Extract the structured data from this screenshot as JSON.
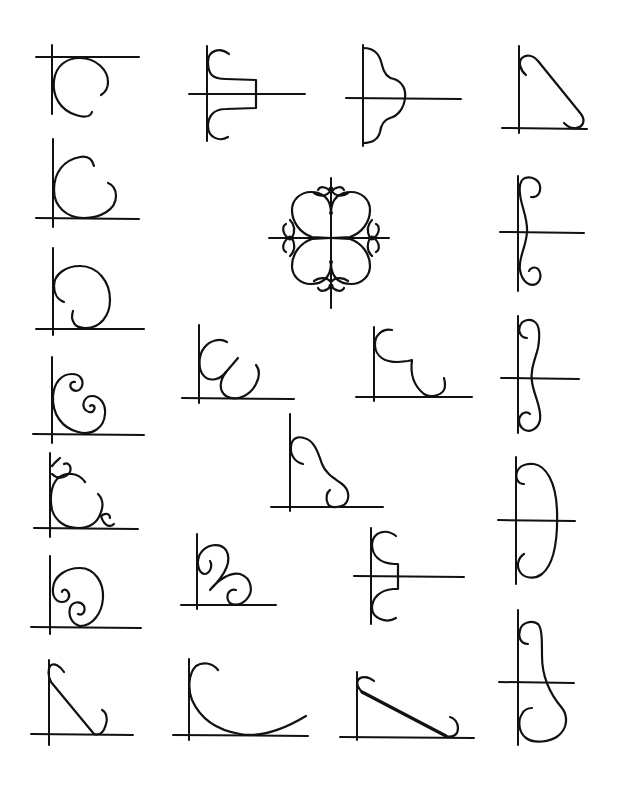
{
  "page": {
    "background": "#ffffff",
    "ink_color": "#111111",
    "figure_count": 25
  },
  "figures": [
    {
      "id": 1,
      "row": 1,
      "col": 1,
      "shape": "open circle scroll hanging below top line"
    },
    {
      "id": 2,
      "row": 1,
      "col": 2,
      "shape": "double C-scroll bracket with square step"
    },
    {
      "id": 3,
      "row": 1,
      "col": 3,
      "shape": "cusped lobed bracket"
    },
    {
      "id": 4,
      "row": 1,
      "col": 4,
      "shape": "diagonal brace with hooked ends"
    },
    {
      "id": 5,
      "row": 2,
      "col": 1,
      "shape": "open C-scroll resting on baseline"
    },
    {
      "id": 6,
      "row": 2,
      "col": 2,
      "shape": "four-lobed quatrefoil ornament with scroll tips"
    },
    {
      "id": 7,
      "row": 2,
      "col": 4,
      "shape": "slender S-scroll pair"
    },
    {
      "id": 8,
      "row": 3,
      "col": 1,
      "shape": "large scroll with inward hook"
    },
    {
      "id": 9,
      "row": 3,
      "col": 2,
      "shape": "double loop W-scroll"
    },
    {
      "id": 10,
      "row": 3,
      "col": 3,
      "shape": "C-scroll with stepped U-scroll"
    },
    {
      "id": 11,
      "row": 3,
      "col": 4,
      "shape": "tall S-scroll pair"
    },
    {
      "id": 12,
      "row": 4,
      "col": 1,
      "shape": "C-scroll with two inner spirals"
    },
    {
      "id": 13,
      "row": 4,
      "col": 3,
      "shape": "S-curve bracket with bottom hook"
    },
    {
      "id": 14,
      "row": 5,
      "col": 1,
      "shape": "C-scroll with small scroll tips"
    },
    {
      "id": 15,
      "row": 5,
      "col": 4,
      "shape": "tall D-shaped bracket with hooks"
    },
    {
      "id": 16,
      "row": 6,
      "col": 1,
      "shape": "spiral scroll with two inner curls"
    },
    {
      "id": 17,
      "row": 6,
      "col": 2,
      "shape": "double loop with pointed join"
    },
    {
      "id": 18,
      "row": 6,
      "col": 3,
      "shape": "double C-scroll bracket with step"
    },
    {
      "id": 19,
      "row": 7,
      "col": 1,
      "shape": "steep diagonal brace with hooks"
    },
    {
      "id": 20,
      "row": 7,
      "col": 2,
      "shape": "long sweeping quarter curve"
    },
    {
      "id": 21,
      "row": 7,
      "col": 3,
      "shape": "beaded diagonal brace with hooks"
    },
    {
      "id": 22,
      "row": 7,
      "col": 4,
      "shape": "tall bulging scroll bracket"
    }
  ]
}
